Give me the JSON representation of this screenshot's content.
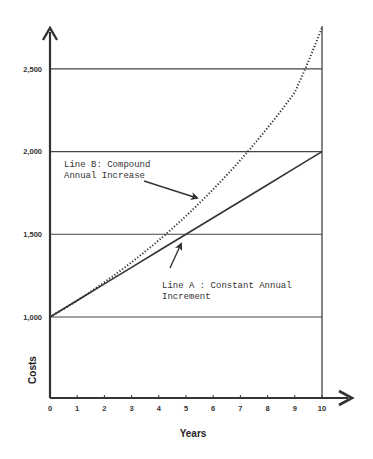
{
  "chart_data": {
    "type": "line",
    "title": "",
    "xlabel": "Years",
    "ylabel": "Costs",
    "xlim": [
      0,
      10
    ],
    "ylim": [
      0,
      2800
    ],
    "x_ticks": [
      "0",
      "1",
      "2",
      "3",
      "4",
      "5",
      "6",
      "7",
      "8",
      "9",
      "10"
    ],
    "y_ticks": [
      "1,000",
      "1,500",
      "2,000",
      "2,500"
    ],
    "y_tick_values": [
      1000,
      1500,
      2000,
      2500
    ],
    "grid": "horizontal at y ticks",
    "legend": "none (inline annotations)",
    "x": [
      0,
      1,
      2,
      3,
      4,
      5,
      6,
      7,
      8,
      9,
      10
    ],
    "series": [
      {
        "name": "Line A: Constant Annual Increment",
        "style": "solid",
        "values": [
          1000,
          1100,
          1200,
          1300,
          1400,
          1500,
          1600,
          1700,
          1800,
          1900,
          2000
        ]
      },
      {
        "name": "Line B: Compound Annual Increase",
        "style": "dotted",
        "values": [
          1000,
          1100,
          1210,
          1331,
          1464,
          1611,
          1772,
          1949,
          2144,
          2358,
          2750
        ]
      }
    ],
    "annotations": [
      {
        "text": "Line B:  Compound",
        "line2": "Annual Increase",
        "points_to": "Line B"
      },
      {
        "text": "Line A :  Constant Annual",
        "line2": "Increment",
        "points_to": "Line A"
      }
    ]
  },
  "labels": {
    "ylabel": "Costs",
    "xlabel": "Years",
    "annot_b_line1": "Line B:  Compound",
    "annot_b_line2": "Annual Increase",
    "annot_a_line1": "Line A :  Constant Annual",
    "annot_a_line2": "Increment"
  },
  "colors": {
    "ink": "#333333",
    "background": "#ffffff"
  }
}
